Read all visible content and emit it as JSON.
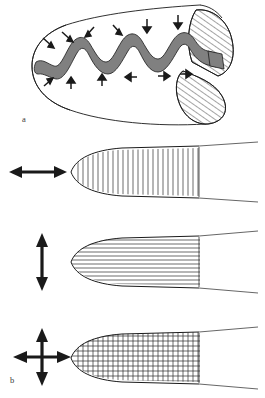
{
  "figure": {
    "type": "scientific-line-diagram",
    "background_color": "#ffffff",
    "stroke_color": "#1a1a1a",
    "band_fill_color": "#808080",
    "hatch_color": "#1a1a1a",
    "width_px": 265,
    "height_px": 398,
    "panels": [
      {
        "id": "a",
        "label": "a",
        "label_x": 22,
        "label_y": 120,
        "caption": "",
        "description": "three-dimensional tapered cylindrical body with rounded apex at left and obliquely cut elliptical open end at right; a shaded wavy circumferential band wraps the body with small arrows pointing toward the band from both sides",
        "elements": [
          "rounded-apex-outline",
          "body-outline",
          "wavy-shaded-band",
          "convergent-arrows",
          "hatched-ellipse-upper",
          "hatched-ellipse-lower"
        ],
        "arrow_count": 12,
        "wave_count": 5
      },
      {
        "id": "b1",
        "label": "",
        "arrow_type": "horizontal-double",
        "arrow_label": "",
        "hatch_pattern": "vertical-lines",
        "hatch_line_count": 24,
        "description": "tip profile with transverse (vertical) hatching indicating expansion along the long axis"
      },
      {
        "id": "b2",
        "label": "",
        "arrow_type": "vertical-double",
        "arrow_label": "",
        "hatch_pattern": "horizontal-lines",
        "hatch_line_count": 14,
        "description": "tip profile with longitudinal (horizontal) hatching indicating expansion across the short axis"
      },
      {
        "id": "b3",
        "label": "b",
        "label_x": 10,
        "label_y": 381,
        "arrow_type": "cross-four-way",
        "arrow_label": "",
        "hatch_pattern": "grid-crosshatch",
        "hatch_line_count": 38,
        "description": "tip profile with square grid hatching indicating isotropic expansion in both axes"
      }
    ]
  }
}
